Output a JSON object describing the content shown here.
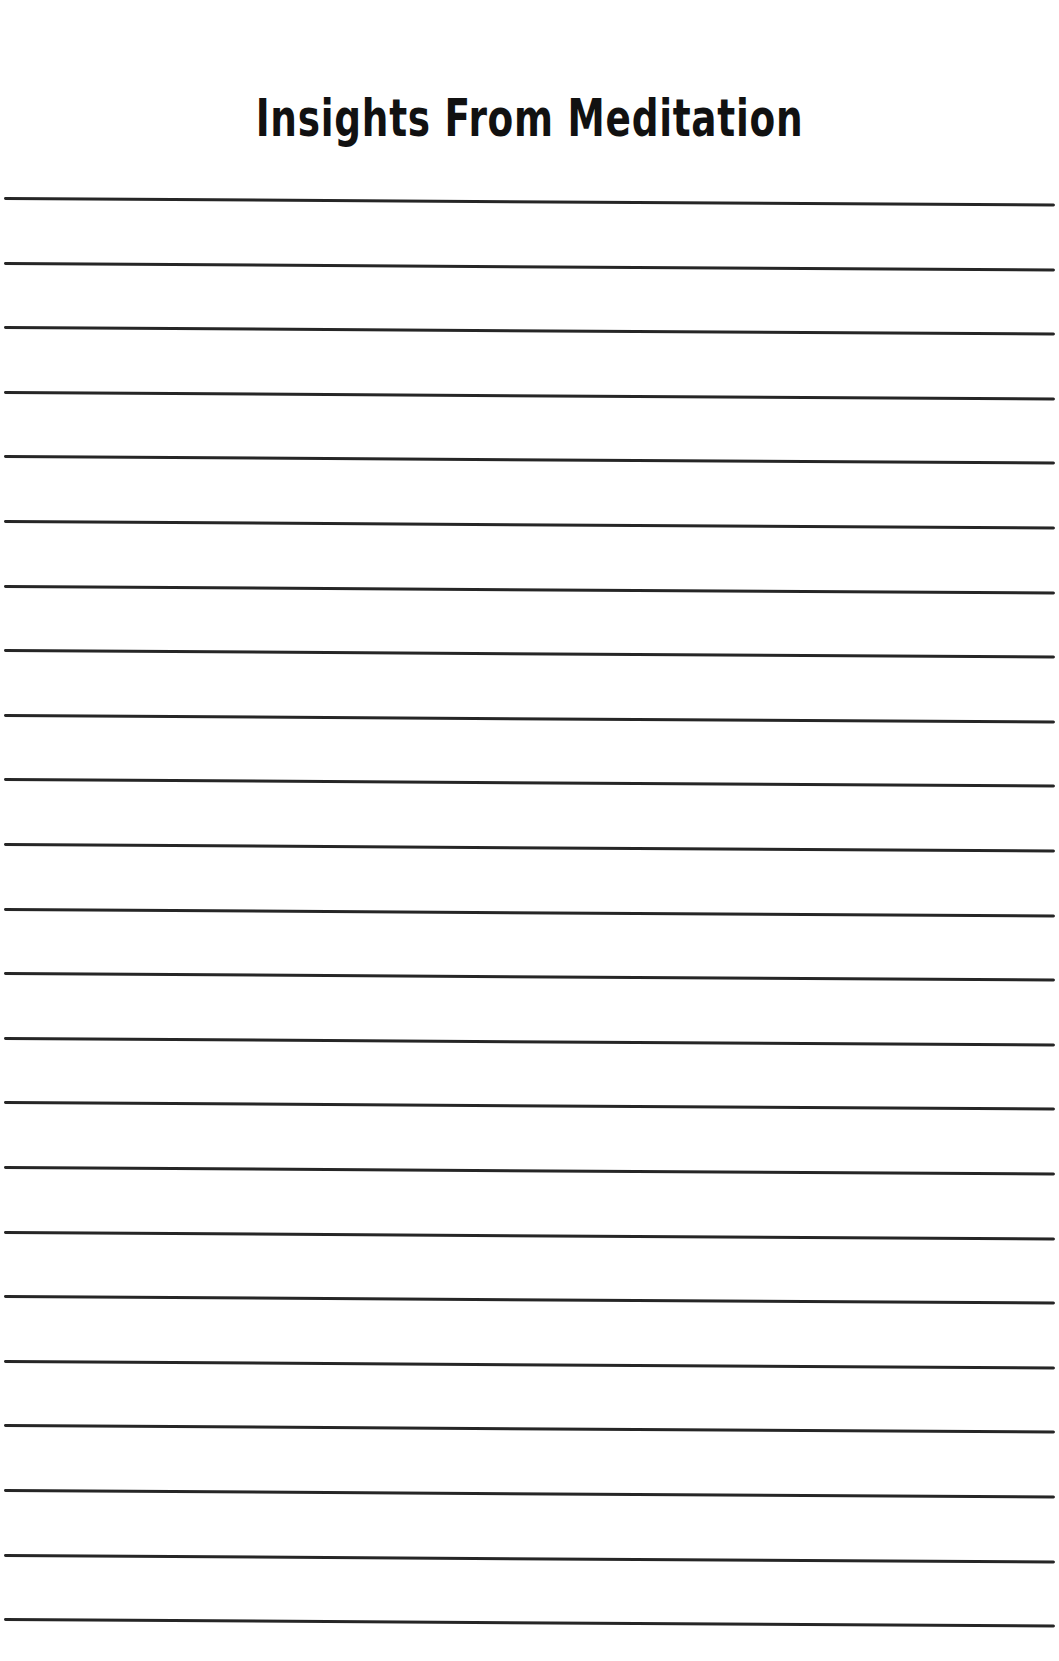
{
  "page": {
    "title": "Insights From Meditation",
    "ruled_lines": {
      "count": 23,
      "first_y": 197,
      "spacing": 64.6,
      "color": "#262626"
    }
  }
}
